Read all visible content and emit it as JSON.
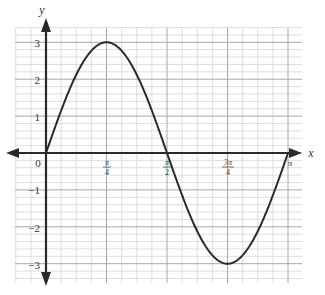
{
  "chart_data": {
    "type": "line",
    "title": "",
    "function": "y = 3 sin(2x)",
    "xlabel": "x",
    "ylabel": "y",
    "xlim": [
      0,
      3.14159
    ],
    "ylim": [
      -3,
      3
    ],
    "grid": true,
    "x_ticks": [
      {
        "value": 0,
        "label": "0"
      },
      {
        "value": 0.7854,
        "label": "π/4"
      },
      {
        "value": 1.5708,
        "label": "π/2"
      },
      {
        "value": 2.3562,
        "label": "3π/4"
      },
      {
        "value": 3.1416,
        "label": "π"
      }
    ],
    "y_ticks": [
      {
        "value": 3,
        "label": "3"
      },
      {
        "value": 2,
        "label": "2"
      },
      {
        "value": 1,
        "label": "1"
      },
      {
        "value": -1,
        "label": "−1"
      },
      {
        "value": -2,
        "label": "−2"
      },
      {
        "value": -3,
        "label": "−3"
      }
    ],
    "series": [
      {
        "name": "curve",
        "x": [
          0,
          0.3927,
          0.7854,
          1.1781,
          1.5708,
          1.9635,
          2.3562,
          2.7489,
          3.1416
        ],
        "y": [
          0,
          2.12,
          3,
          2.12,
          0,
          -2.12,
          -3,
          -2.12,
          0
        ]
      }
    ],
    "key_points": [
      {
        "x": "0",
        "y": 0
      },
      {
        "x": "π/4",
        "y": 3
      },
      {
        "x": "π/2",
        "y": 0
      },
      {
        "x": "3π/4",
        "y": -3
      },
      {
        "x": "π",
        "y": 0
      }
    ]
  },
  "labels": {
    "x_axis": "x",
    "y_axis": "y",
    "origin": "0",
    "x_ticks": [
      {
        "num": "π",
        "den": "4"
      },
      {
        "num": "π",
        "den": "2"
      },
      {
        "num": "3π",
        "den": "4"
      },
      {
        "num": "π",
        "den": ""
      }
    ],
    "y_ticks": [
      "3",
      "2",
      "1",
      "−1",
      "−2",
      "−3"
    ]
  },
  "colors": {
    "grid_minor": "#d6d6d6",
    "grid_major": "#a8a8a8",
    "axis": "#2a2a2a",
    "curve": "#2a2a2a"
  }
}
